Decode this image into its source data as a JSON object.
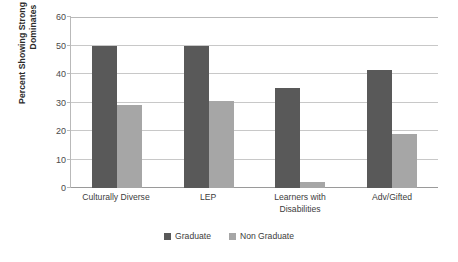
{
  "chart_data": {
    "type": "bar",
    "title": "",
    "xlabel": "",
    "ylabel": "Percent Showing Strong Influence to Dominates",
    "ylabel_lines": [
      "Percent Showing Strong Influence to",
      "Dominates"
    ],
    "categories": [
      "Culturally Diverse",
      "LEP",
      "Learners with Disabilities",
      "Adv/Gifted"
    ],
    "category_lines": [
      [
        "Culturally Diverse"
      ],
      [
        "LEP"
      ],
      [
        "Learners with",
        "Disabilities"
      ],
      [
        "Adv/Gifted"
      ]
    ],
    "series": [
      {
        "name": "Graduate",
        "color": "#595959",
        "values": [
          50,
          50,
          35,
          41.5
        ]
      },
      {
        "name": "Non Graduate",
        "color": "#a6a6a6",
        "values": [
          29,
          30.5,
          2,
          18.8
        ]
      }
    ],
    "ylim": [
      0,
      60
    ],
    "yticks": [
      0,
      10,
      20,
      30,
      40,
      50,
      60
    ],
    "ytick_labels": [
      "0",
      "10",
      "20",
      "30",
      "40",
      "50",
      "60"
    ],
    "grid": true,
    "legend_position": "bottom"
  },
  "legend": {
    "items": [
      {
        "label": "Graduate",
        "color": "#595959"
      },
      {
        "label": "Non Graduate",
        "color": "#a6a6a6"
      }
    ]
  }
}
